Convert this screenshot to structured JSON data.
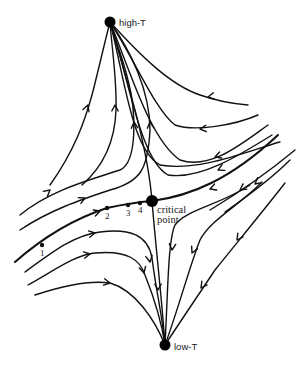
{
  "figure": {
    "fixed_points": [
      {
        "id": "high-T",
        "label": "high-T",
        "x": 110,
        "y": 22,
        "r": 5.5,
        "label_x": 119,
        "label_y": 26,
        "label_style": "sans"
      },
      {
        "id": "critical",
        "label_lines": [
          "critical",
          "point"
        ],
        "x": 152,
        "y": 201,
        "r": 6,
        "label_x": 157,
        "label_y": 214,
        "label_style": "serif"
      },
      {
        "id": "low-T",
        "label": "low-T",
        "x": 165,
        "y": 345,
        "r": 5.5,
        "label_x": 174,
        "label_y": 350,
        "label_style": "sans"
      }
    ],
    "labels": {
      "high_t": "high-T",
      "critical_line1": "critical",
      "critical_line2": "point",
      "low_t": "low-T"
    },
    "trajectory_points": [
      {
        "label": "1",
        "x": 42,
        "y": 245,
        "tx": 40,
        "ty": 256
      },
      {
        "label": "2",
        "x": 107,
        "y": 208,
        "tx": 105,
        "ty": 219
      },
      {
        "label": "3",
        "x": 128,
        "y": 205,
        "tx": 126,
        "ty": 216
      },
      {
        "label": "4",
        "x": 140,
        "y": 203,
        "tx": 138,
        "ty": 213
      }
    ],
    "flow_lines": [
      {
        "name": "left-to-high-1",
        "d": "M50,185 C75,150 85,120 92,95 C98,72 104,45 110,22",
        "arrows": [
          [
            88,
            105,
            -70
          ]
        ],
        "thick": false
      },
      {
        "name": "left-to-high-2",
        "d": "M82,185 C105,165 115,140 116,110 C117,80 112,50 110,22",
        "arrows": [
          [
            115,
            105,
            -90
          ]
        ],
        "thick": false
      },
      {
        "name": "left-to-high-3",
        "d": "M20,215 C50,190 90,180 120,170 C138,162 136,110 128,80 C122,55 115,40 110,22",
        "arrows": [
          [
            134,
            122,
            -95
          ],
          [
            50,
            190,
            -40
          ]
        ],
        "thick": false
      },
      {
        "name": "left-to-high-4",
        "d": "M20,230 C50,210 80,200 110,190 C140,182 148,170 150,130 C150,90 130,50 110,22",
        "arrows": [
          [
            150,
            122,
            -95
          ],
          [
            85,
            198,
            -25
          ]
        ],
        "thick": false
      },
      {
        "name": "critical-vertical-separatrix",
        "d": "M110,22 C130,90 148,150 152,201 C156,250 162,300 165,345",
        "arrows": [
          [
            158,
            290,
            90
          ]
        ],
        "thick": false
      },
      {
        "name": "high-to-right-1",
        "d": "M110,22 C140,55 170,85 200,95 C220,102 235,104 248,105",
        "arrows": [
          [
            208,
            97,
            170
          ]
        ],
        "thick": false
      },
      {
        "name": "high-to-right-2",
        "d": "M110,22 C135,60 155,110 175,125 C195,132 235,125 258,115",
        "arrows": [
          [
            200,
            129,
            175
          ]
        ],
        "thick": false
      },
      {
        "name": "high-to-right-3",
        "d": "M110,22 C130,70 150,140 180,160 C210,170 240,145 268,125",
        "arrows": [
          [
            215,
            157,
            160
          ]
        ],
        "thick": false
      },
      {
        "name": "high-to-right-4",
        "d": "M110,22 C128,75 140,160 168,175 C200,180 240,155 272,135",
        "arrows": [
          [
            218,
            170,
            155
          ]
        ],
        "thick": false
      },
      {
        "name": "separatrix-horizontal-left",
        "d": "M15,262 C40,240 70,220 107,208 C125,204 140,202 152,201",
        "arrows": [
          [
            100,
            211,
            -20
          ]
        ],
        "thick": true
      },
      {
        "name": "separatrix-horizontal-right",
        "d": "M152,201 C190,196 230,180 278,135",
        "arrows": [
          [
            210,
            189,
            160
          ]
        ],
        "thick": true
      },
      {
        "name": "right-to-high-5",
        "d": "M110,22 C125,80 132,150 160,165 C200,172 250,150 280,142",
        "arrows": [],
        "thick": false
      },
      {
        "name": "left-to-low-1",
        "d": "M25,272 C55,250 75,235 100,232 C130,228 148,235 152,258 C156,290 163,320 165,345",
        "arrows": [
          [
            95,
            233,
            -10
          ],
          [
            150,
            262,
            80
          ]
        ],
        "thick": false
      },
      {
        "name": "left-to-low-2",
        "d": "M28,285 C55,270 75,255 95,253 C128,250 140,260 145,275 C155,300 162,325 165,345",
        "arrows": [
          [
            90,
            254,
            -10
          ],
          [
            144,
            273,
            75
          ]
        ],
        "thick": false
      },
      {
        "name": "left-to-low-3",
        "d": "M35,295 C65,285 90,280 110,283 C135,290 155,320 165,345",
        "arrows": [
          [
            110,
            283,
            10
          ]
        ],
        "thick": false
      },
      {
        "name": "right-to-low-1",
        "d": "M250,185 C220,205 185,210 175,225 C168,240 168,290 165,345",
        "arrows": [
          [
            172,
            250,
            95
          ]
        ],
        "thick": false
      },
      {
        "name": "right-to-low-2",
        "d": "M262,182 C240,205 210,220 200,240 C190,265 178,310 165,345",
        "arrows": [
          [
            192,
            253,
            115
          ]
        ],
        "thick": false
      },
      {
        "name": "right-to-low-3",
        "d": "M285,183 C260,215 235,245 215,270 C195,300 178,325 165,345",
        "arrows": [
          [
            237,
            240,
            125
          ],
          [
            201,
            288,
            125
          ]
        ],
        "thick": false
      },
      {
        "name": "right-upper-to-critical",
        "d": "M295,150 C265,175 235,195 210,210",
        "arrows": [
          [
            240,
            190,
            145
          ]
        ],
        "thick": false
      },
      {
        "name": "right-upper-edge",
        "d": "M290,160 C270,180 245,198 225,212",
        "arrows": [
          [
            255,
            184,
            140
          ]
        ],
        "thick": false
      }
    ]
  }
}
